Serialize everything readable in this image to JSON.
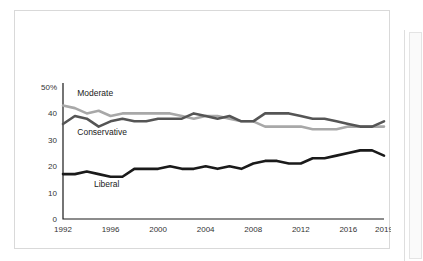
{
  "chart_data": {
    "type": "line",
    "title": "",
    "subtitle": "",
    "xlabel": "",
    "ylabel": "",
    "xlim": [
      1992,
      2019
    ],
    "ylim": [
      0,
      50
    ],
    "grid": false,
    "legend_position": "inline-labels",
    "y_ticks": [
      "0",
      "10",
      "20",
      "30",
      "40",
      "50%"
    ],
    "y_tick_values": [
      0,
      10,
      20,
      30,
      40,
      50
    ],
    "x_ticks": [
      "1992",
      "1996",
      "2000",
      "2004",
      "2008",
      "2012",
      "2016",
      "2019"
    ],
    "x_tick_values": [
      1992,
      1996,
      2000,
      2004,
      2008,
      2012,
      2016,
      2019
    ],
    "x": [
      1992,
      1993,
      1994,
      1995,
      1996,
      1997,
      1998,
      1999,
      2000,
      2001,
      2002,
      2003,
      2004,
      2005,
      2006,
      2007,
      2008,
      2009,
      2010,
      2011,
      2012,
      2013,
      2014,
      2015,
      2016,
      2017,
      2018,
      2019
    ],
    "series": [
      {
        "name": "Moderate",
        "color": "#a8a8a8",
        "label": "Moderate",
        "values": [
          43,
          42,
          40,
          41,
          39,
          40,
          40,
          40,
          40,
          40,
          39,
          38,
          39,
          39,
          38,
          37,
          37,
          35,
          35,
          35,
          35,
          34,
          34,
          34,
          35,
          35,
          35,
          35
        ]
      },
      {
        "name": "Conservative",
        "color": "#555555",
        "label": "Conservative",
        "values": [
          36,
          39,
          38,
          35,
          37,
          38,
          37,
          37,
          38,
          38,
          38,
          40,
          39,
          38,
          39,
          37,
          37,
          40,
          40,
          40,
          39,
          38,
          38,
          37,
          36,
          35,
          35,
          37
        ]
      },
      {
        "name": "Liberal",
        "color": "#1a1a1a",
        "label": "Liberal",
        "values": [
          17,
          17,
          18,
          17,
          16,
          16,
          19,
          19,
          19,
          20,
          19,
          19,
          20,
          19,
          20,
          19,
          21,
          22,
          22,
          21,
          21,
          23,
          23,
          24,
          25,
          26,
          26,
          24
        ]
      }
    ],
    "annotations": [
      {
        "text": "Moderate",
        "x": 1993.2,
        "y": 46.5
      },
      {
        "text": "Conservative",
        "x": 1993.2,
        "y": 31.8
      },
      {
        "text": "Liberal",
        "x": 1994.6,
        "y": 12.0
      }
    ]
  },
  "colors": {
    "moderate": "#a8a8a8",
    "conservative": "#555555",
    "liberal": "#1a1a1a",
    "axis": "#1a1a1a",
    "tick_text": "#333333",
    "card_border": "#d9d9d9",
    "background": "#ffffff"
  }
}
